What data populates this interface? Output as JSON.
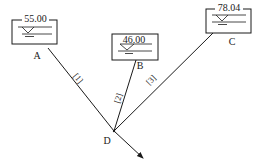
{
  "diagram": {
    "type": "three-reservoir pipe network",
    "colors": {
      "line": "#1a1a1a",
      "background": "#ffffff"
    },
    "reservoirs": [
      {
        "id": "A",
        "label": "A",
        "elevation": "55.00"
      },
      {
        "id": "B",
        "label": "B",
        "elevation": "46.00"
      },
      {
        "id": "C",
        "label": "C",
        "elevation": "78.04"
      }
    ],
    "junction": {
      "id": "D",
      "label": "D"
    },
    "pipes": [
      {
        "id": "1",
        "label": "[1]",
        "from": "A",
        "to": "D"
      },
      {
        "id": "2",
        "label": "[2]",
        "from": "B",
        "to": "D"
      },
      {
        "id": "3",
        "label": "[3]",
        "from": "C",
        "to": "D"
      }
    ],
    "outflow": {
      "from": "D",
      "icon": "arrow-icon"
    }
  }
}
